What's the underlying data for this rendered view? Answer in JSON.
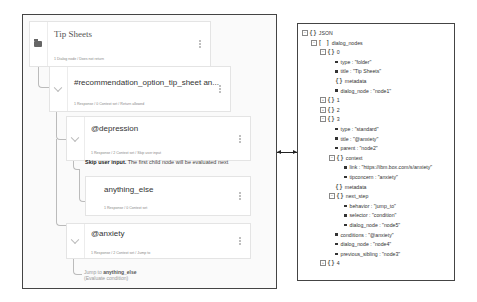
{
  "dialog_tree": {
    "nodes": [
      {
        "id": "tip-sheets",
        "title": "Tip Sheets",
        "meta": "1 Dialog node / Does not return",
        "icon": "folder-icon"
      },
      {
        "id": "recommendation",
        "title": "#recommendation_option_tip_sheet an...",
        "meta": "1 Response / 0 Context set / Return allowed",
        "icon": "chevron-down-icon"
      },
      {
        "id": "depression",
        "title": "@depression",
        "meta": "1 Response / 2 Context set / Skip user input",
        "icon": "chevron-down-icon"
      },
      {
        "id": "anything-else",
        "title": "anything_else",
        "meta": "1 Response / 0 Context set",
        "icon": ""
      },
      {
        "id": "anxiety",
        "title": "@anxiety",
        "meta": "1 Response / 2 Context set / Jump to",
        "icon": "chevron-down-icon"
      }
    ],
    "skip_note": {
      "bold": "Skip user input.",
      "text": " The first child node will be evaluated next"
    },
    "jump_note": {
      "prefix": "Jump to ",
      "target": "anything_else",
      "suffix": "(Evaluate condition)"
    }
  },
  "json_tree": {
    "rows": [
      {
        "depth": 0,
        "toggle": "-",
        "kind": "object",
        "label": "JSON"
      },
      {
        "depth": 1,
        "toggle": "-",
        "kind": "array",
        "label": "dialog_nodes"
      },
      {
        "depth": 2,
        "toggle": "-",
        "kind": "object",
        "label": "0"
      },
      {
        "depth": 3,
        "kind": "value",
        "label": "type : \"folder\""
      },
      {
        "depth": 3,
        "kind": "value",
        "label": "title : \"Tip Sheets\""
      },
      {
        "depth": 3,
        "kind": "object",
        "label": "metadata"
      },
      {
        "depth": 3,
        "kind": "value",
        "label": "dialog_node : \"node1\""
      },
      {
        "depth": 2,
        "toggle": "+",
        "kind": "object",
        "label": "1"
      },
      {
        "depth": 2,
        "toggle": "+",
        "kind": "object",
        "label": "2"
      },
      {
        "depth": 2,
        "toggle": "-",
        "kind": "object",
        "label": "3"
      },
      {
        "depth": 3,
        "kind": "value",
        "label": "type : \"standard\""
      },
      {
        "depth": 3,
        "kind": "value",
        "label": "title : \"@anxiety\""
      },
      {
        "depth": 3,
        "kind": "value",
        "label": "parent : \"node2\""
      },
      {
        "depth": 3,
        "toggle": "-",
        "kind": "object",
        "label": "context"
      },
      {
        "depth": 4,
        "kind": "value",
        "label": "link : \"https://ibm.box.com/s/anxiety\""
      },
      {
        "depth": 4,
        "kind": "value",
        "label": "tipconcern : \"anxiety\""
      },
      {
        "depth": 3,
        "kind": "object",
        "label": "metadata"
      },
      {
        "depth": 3,
        "toggle": "-",
        "kind": "object",
        "label": "next_step"
      },
      {
        "depth": 4,
        "kind": "value",
        "label": "behavior : \"jump_to\""
      },
      {
        "depth": 4,
        "kind": "value",
        "label": "selector : \"condition\""
      },
      {
        "depth": 4,
        "kind": "value",
        "label": "dialog_node : \"node5\""
      },
      {
        "depth": 3,
        "kind": "value",
        "label": "conditions : \"@anxiety\""
      },
      {
        "depth": 3,
        "kind": "value",
        "label": "dialog_node : \"node4\""
      },
      {
        "depth": 3,
        "kind": "value",
        "label": "previous_sibling : \"node3\""
      },
      {
        "depth": 2,
        "toggle": "+",
        "kind": "object",
        "label": "4"
      }
    ]
  }
}
